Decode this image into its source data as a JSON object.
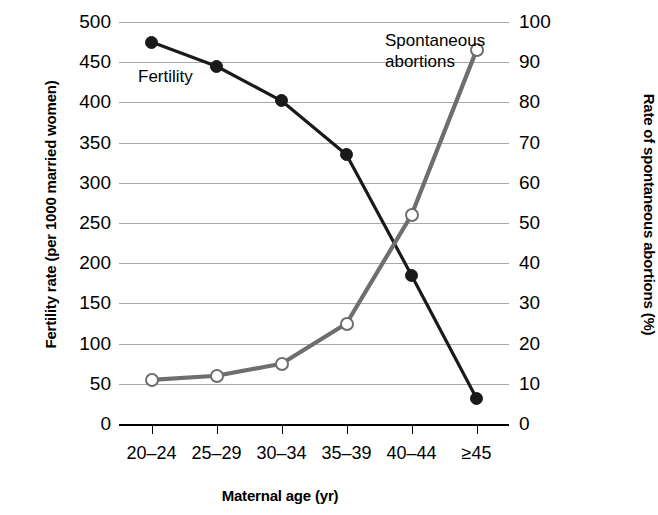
{
  "chart_data": {
    "type": "line",
    "title": "",
    "xlabel": "Maternal age (yr)",
    "ylabel": "Fertility rate (per 1000 married women)",
    "y2label": "Rate of spontaneous abortions (%)",
    "categories": [
      "20–24",
      "25–29",
      "30–34",
      "35–39",
      "40–44",
      "≥45"
    ],
    "ylim": [
      0,
      500
    ],
    "y2lim": [
      0,
      100
    ],
    "yticks": [
      0,
      50,
      100,
      150,
      200,
      250,
      300,
      350,
      400,
      450,
      500
    ],
    "y2ticks": [
      0,
      10,
      20,
      30,
      40,
      50,
      60,
      70,
      80,
      90,
      100
    ],
    "grid": true,
    "legend_position": "inline-annotations",
    "series": [
      {
        "name": "Fertility",
        "axis": "left",
        "color": "#1a1a1a",
        "marker": "filled-circle",
        "values": [
          475,
          445,
          402,
          335,
          185,
          32
        ]
      },
      {
        "name": "Spontaneous abortions",
        "axis": "right",
        "color": "#6e6e6e",
        "marker": "open-circle",
        "values": [
          11,
          12,
          15,
          25,
          52,
          93
        ]
      }
    ],
    "annotations": [
      {
        "text": "Fertility",
        "series": "Fertility"
      },
      {
        "text": "Spontaneous",
        "series": "Spontaneous abortions"
      },
      {
        "text": "abortions",
        "series": "Spontaneous abortions"
      }
    ]
  },
  "axes": {
    "left": {
      "title": "Fertility rate (per 1000 married women)",
      "labels": [
        "500",
        "450",
        "400",
        "350",
        "300",
        "250",
        "200",
        "150",
        "100",
        "50",
        "0"
      ]
    },
    "right": {
      "title": "Rate of spontaneous abortions (%)",
      "labels": [
        "100",
        "90",
        "80",
        "70",
        "60",
        "50",
        "40",
        "30",
        "20",
        "10",
        "0"
      ]
    },
    "x": {
      "title": "Maternal age (yr)",
      "labels": [
        "20–24",
        "25–29",
        "30–34",
        "35–39",
        "40–44",
        "≥45"
      ]
    }
  },
  "annotations": {
    "fertility": "Fertility",
    "abortions_line1": "Spontaneous",
    "abortions_line2": "abortions"
  },
  "colors": {
    "fertility": "#1a1a1a",
    "abortions": "#6e6e6e",
    "grid": "#a8a8a8",
    "axis": "#000000",
    "background": "#ffffff"
  }
}
